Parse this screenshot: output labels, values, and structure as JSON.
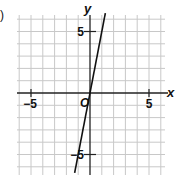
{
  "figure": {
    "part_label": ")"
  },
  "chart_data": {
    "type": "line",
    "title": "",
    "xlabel": "x",
    "ylabel": "y",
    "origin_label": "O",
    "xlim": [
      -6,
      6
    ],
    "ylim": [
      -6.5,
      6.5
    ],
    "grid": true,
    "grid_step": 1,
    "x_ticks": [
      -5,
      5
    ],
    "y_ticks": [
      5,
      -5
    ],
    "x_tick_labels": [
      "−5",
      "5"
    ],
    "y_tick_labels": [
      "5",
      "−5"
    ],
    "series": [
      {
        "name": "y = 5x",
        "equation": "y = 5x",
        "x": [
          -1.3,
          1.3
        ],
        "y": [
          -6.5,
          6.5
        ]
      }
    ],
    "colors": {
      "grid": "#c8c8c8",
      "axis": "#222222",
      "line": "#111111"
    }
  }
}
